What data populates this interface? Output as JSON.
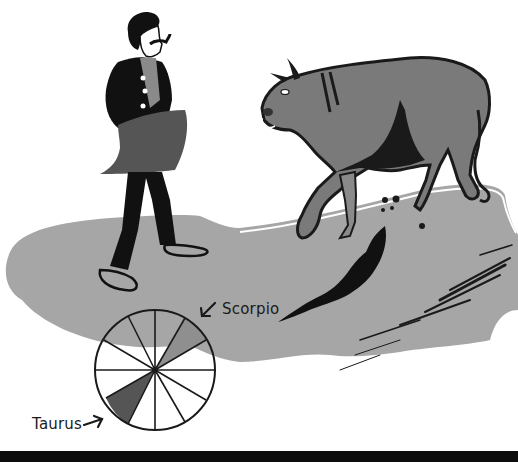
{
  "illustration": {
    "labels": {
      "scorpio": "Scorpio",
      "taurus": "Taurus"
    },
    "zodiac_wheel": {
      "spokes": 12,
      "highlighted_segments": [
        "Scorpio",
        "Taurus"
      ]
    },
    "colors": {
      "background": "#ffffff",
      "ground": "#a6a6a6",
      "bull_body": "#7a7a7a",
      "dark": "#1a1a1a",
      "scorpio_segment": "#8f8f8f",
      "taurus_segment": "#555555",
      "bottom_strip": "#0d0d0d"
    },
    "figures": [
      "matador",
      "bull",
      "zodiac-wheel",
      "ground-shadow"
    ]
  }
}
